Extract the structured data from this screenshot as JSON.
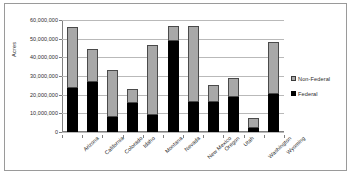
{
  "chart_data": {
    "type": "bar",
    "stacked": true,
    "title": "",
    "xlabel": "",
    "ylabel": "Acres",
    "ylim": [
      0,
      60000000
    ],
    "ytick_step": 10000000,
    "ytick_labels": [
      "60,000,000",
      "50,000,000",
      "40,000,000",
      "30,000,000",
      "20,000,000",
      "10,000,000",
      "0"
    ],
    "grid": true,
    "legend_position": "right",
    "categories": [
      "Arizona",
      "California",
      "Colorado",
      "Idaho",
      "Montana",
      "Nevada",
      "New Mexico",
      "Oregon",
      "Utah",
      "Washington",
      "Wyoming"
    ],
    "series": [
      {
        "name": "Federal",
        "color": "#000000",
        "values": [
          23500000,
          27000000,
          8000000,
          15800000,
          9300000,
          48500000,
          16200000,
          16200000,
          18500000,
          2000000,
          20500000
        ]
      },
      {
        "name": "Non-Federal",
        "color": "#a8a8a8",
        "values": [
          32800000,
          17300000,
          25300000,
          7200000,
          37200000,
          8100000,
          40400000,
          9100000,
          10500000,
          5700000,
          27700000
        ]
      }
    ],
    "totals": [
      56300000,
      44300000,
      33300000,
      23000000,
      46500000,
      56600000,
      56600000,
      25300000,
      29000000,
      7700000,
      48200000
    ]
  },
  "legend": {
    "items": [
      {
        "label": "Non-Federal",
        "swatch": "nonfederal-swatch"
      },
      {
        "label": "Federal",
        "swatch": "federal-swatch"
      }
    ]
  },
  "axis": {
    "y_title": "Acres"
  }
}
